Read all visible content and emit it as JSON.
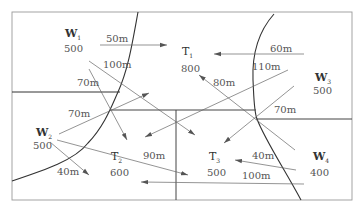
{
  "nodes": {
    "W1": {
      "name": "W",
      "sub": "1",
      "value": "500"
    },
    "W2": {
      "name": "W",
      "sub": "2",
      "value": "500"
    },
    "W3": {
      "name": "W",
      "sub": "3",
      "value": "500"
    },
    "W4": {
      "name": "W",
      "sub": "4",
      "value": "400"
    },
    "T1": {
      "name": "T",
      "sub": "1",
      "value": "800"
    },
    "T2": {
      "name": "T",
      "sub": "2",
      "value": "600"
    },
    "T3": {
      "name": "T",
      "sub": "3",
      "value": "500"
    }
  },
  "edges": [
    {
      "from": "W1",
      "to": "T1",
      "label": "50m"
    },
    {
      "from": "W1",
      "to": "T3",
      "label": "100m"
    },
    {
      "from": "W1",
      "to": "T2",
      "label": "70m"
    },
    {
      "from": "W2",
      "to": "T1",
      "label": "70m"
    },
    {
      "from": "W2",
      "to": "T2",
      "label": "40m"
    },
    {
      "from": "W2",
      "to": "T3",
      "label": "90m"
    },
    {
      "from": "W3",
      "to": "T1",
      "label": "60m"
    },
    {
      "from": "W3",
      "to": "T2",
      "label": "110m"
    },
    {
      "from": "W3",
      "to": "T3",
      "label": "70m"
    },
    {
      "from": "W4",
      "to": "T1",
      "label": "80m"
    },
    {
      "from": "W4",
      "to": "T3",
      "label": "40m"
    },
    {
      "from": "W4",
      "to": "T2",
      "label": "100m"
    }
  ],
  "colors": {
    "border": "#888888",
    "boundary": "#333333",
    "arrow": "#666666",
    "text": "#444444"
  }
}
